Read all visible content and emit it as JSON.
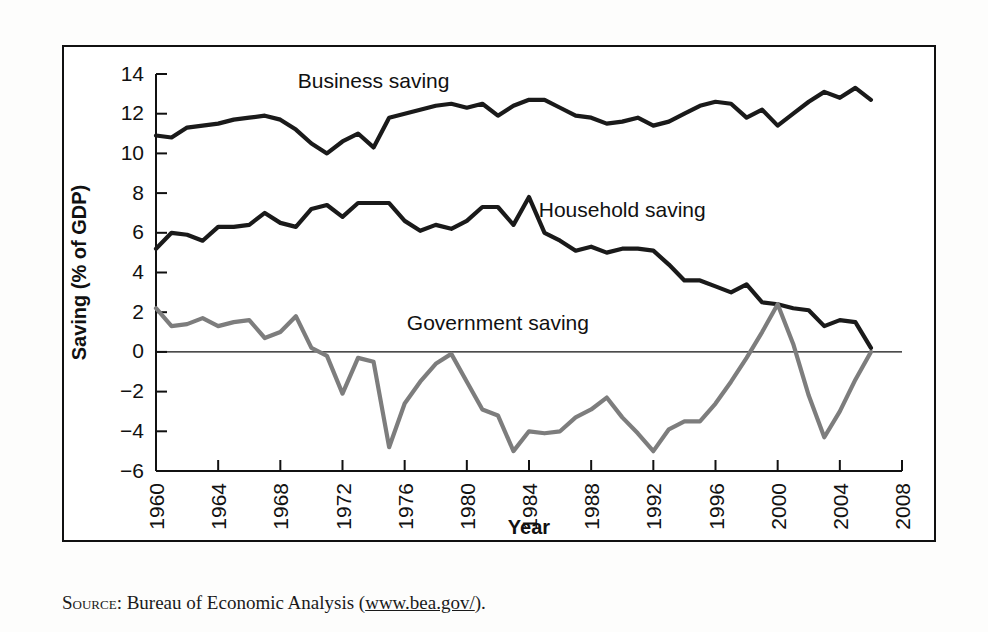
{
  "figure": {
    "caption_prefix": "Source:",
    "caption_text": " Bureau of Economic Analysis (",
    "caption_url": "www.bea.gov/",
    "caption_suffix": ")."
  },
  "chart_data": {
    "type": "line",
    "title": "",
    "xlabel": "Year",
    "ylabel": "Saving (% of GDP)",
    "xlim": [
      1960,
      2008
    ],
    "ylim": [
      -6,
      14
    ],
    "xticks": [
      1960,
      1964,
      1968,
      1972,
      1976,
      1980,
      1984,
      1988,
      1992,
      1996,
      2000,
      2004,
      2008
    ],
    "yticks": [
      -6,
      -4,
      -2,
      0,
      2,
      4,
      6,
      8,
      10,
      12,
      14
    ],
    "xtick_labels": [
      "1960",
      "1964",
      "1968",
      "1972",
      "1976",
      "1980",
      "1984",
      "1988",
      "1992",
      "1996",
      "2000",
      "2004",
      "2008"
    ],
    "ytick_labels": [
      "-6",
      "-4",
      "-2",
      "0",
      "2",
      "4",
      "6",
      "8",
      "10",
      "12",
      "14"
    ],
    "grid": false,
    "legend_position": "inline-annotations",
    "zero_line": true,
    "x": [
      1960,
      1961,
      1962,
      1963,
      1964,
      1965,
      1966,
      1967,
      1968,
      1969,
      1970,
      1971,
      1972,
      1973,
      1974,
      1975,
      1976,
      1977,
      1978,
      1979,
      1980,
      1981,
      1982,
      1983,
      1984,
      1985,
      1986,
      1987,
      1988,
      1989,
      1990,
      1991,
      1992,
      1993,
      1994,
      1995,
      1996,
      1997,
      1998,
      1999,
      2000,
      2001,
      2002,
      2003,
      2004,
      2005,
      2006
    ],
    "series": [
      {
        "name": "Business saving",
        "color": "#1a1a1a",
        "label_x": 1974,
        "label_y": 13.3,
        "values": [
          10.9,
          10.8,
          11.3,
          11.4,
          11.5,
          11.7,
          11.8,
          11.9,
          11.7,
          11.2,
          10.5,
          10.0,
          10.6,
          11.0,
          10.3,
          11.8,
          12.0,
          12.2,
          12.4,
          12.5,
          12.3,
          12.5,
          11.9,
          12.4,
          12.7,
          12.7,
          12.3,
          11.9,
          11.8,
          11.5,
          11.6,
          11.8,
          11.4,
          11.6,
          12.0,
          12.4,
          12.6,
          12.5,
          11.8,
          12.2,
          11.4,
          12.0,
          12.6,
          13.1,
          12.8,
          13.3,
          12.7
        ]
      },
      {
        "name": "Household saving",
        "color": "#1a1a1a",
        "label_x": 1990,
        "label_y": 6.8,
        "values": [
          5.2,
          6.0,
          5.9,
          5.6,
          6.3,
          6.3,
          6.4,
          7.0,
          6.5,
          6.3,
          7.2,
          7.4,
          6.8,
          7.5,
          7.5,
          7.5,
          6.6,
          6.1,
          6.4,
          6.2,
          6.6,
          7.3,
          7.3,
          6.4,
          7.8,
          6.0,
          5.6,
          5.1,
          5.3,
          5.0,
          5.2,
          5.2,
          5.1,
          4.4,
          3.6,
          3.6,
          3.3,
          3.0,
          3.4,
          2.5,
          2.4,
          2.2,
          2.1,
          1.3,
          1.6,
          1.5,
          0.2
        ]
      },
      {
        "name": "Government saving",
        "color": "#7d7d7d",
        "label_x": 1982,
        "label_y": 1.1,
        "values": [
          2.2,
          1.3,
          1.4,
          1.7,
          1.3,
          1.5,
          1.6,
          0.7,
          1.0,
          1.8,
          0.2,
          -0.2,
          -2.1,
          -0.3,
          -0.5,
          -4.8,
          -2.6,
          -1.5,
          -0.6,
          -0.1,
          -1.5,
          -2.9,
          -3.2,
          -5.0,
          -4.0,
          -4.1,
          -4.0,
          -3.3,
          -2.9,
          -2.3,
          -3.3,
          -4.1,
          -5.0,
          -3.9,
          -3.5,
          -3.5,
          -2.6,
          -1.5,
          -0.3,
          1.0,
          2.4,
          0.4,
          -2.2,
          -4.3,
          -3.0,
          -1.4,
          0.0
        ]
      }
    ]
  }
}
